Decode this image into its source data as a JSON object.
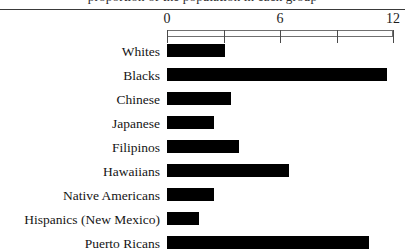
{
  "figure": {
    "title_remnant": "proportion of the population in each group",
    "axis": {
      "min": 0,
      "max": 12,
      "ticks": [
        0,
        3,
        6,
        9,
        12
      ],
      "labeled_ticks": [
        {
          "value": 0,
          "label": "0"
        },
        {
          "value": 6,
          "label": "6"
        },
        {
          "value": 12,
          "label": "12"
        }
      ]
    }
  },
  "chart_data": {
    "type": "bar",
    "orientation": "horizontal",
    "title": "",
    "xlabel": "",
    "ylabel": "",
    "xlim": [
      0,
      12
    ],
    "grid": false,
    "legend": null,
    "bar_color": "#000000",
    "categories": [
      "Whites",
      "Blacks",
      "Chinese",
      "Japanese",
      "Filipinos",
      "Hawaiians",
      "Native Americans",
      "Hispanics (New Mexico)",
      "Puerto Ricans"
    ],
    "values": [
      3.1,
      11.7,
      3.4,
      2.5,
      3.8,
      6.5,
      2.5,
      1.7,
      10.7
    ],
    "tick_labels": [
      "0",
      "6",
      "12"
    ]
  }
}
